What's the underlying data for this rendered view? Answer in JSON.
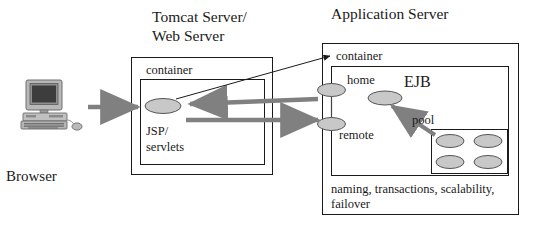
{
  "diagram": {
    "title_tomcat_line1": "Tomcat Server/",
    "title_tomcat_line2": "Web Server",
    "title_appserver": "Application Server",
    "browser_label": "Browser",
    "browser_icon": "desktop-computer-icon",
    "tomcat": {
      "container_label": "container",
      "web_node_line1": "JSP/",
      "web_node_line2": "servlets",
      "web_node_shape": "ellipse"
    },
    "appserver": {
      "container_label": "container",
      "home_label": "home",
      "remote_label": "remote",
      "ejb_label": "EJB",
      "pool_label": "pool",
      "services_line1": "naming, transactions, scalability,",
      "services_line2": "failover",
      "pool_instance_count": 4
    },
    "arrows": [
      {
        "name": "browser-to-web-container",
        "style": "thick-gray",
        "direction": "right"
      },
      {
        "name": "web-to-ejb-request",
        "style": "thick-gray",
        "direction": "right"
      },
      {
        "name": "ejb-to-web-response",
        "style": "thick-gray",
        "direction": "left"
      },
      {
        "name": "container-callout",
        "style": "thin-black",
        "direction": "up-right"
      },
      {
        "name": "pool-to-ejb",
        "style": "thick-gray",
        "direction": "up-left"
      }
    ],
    "colors": {
      "arrow_gray": "#808080",
      "ellipse_fill": "#c8c8c8",
      "stroke_black": "#1a1a1a",
      "background": "#ffffff"
    }
  }
}
